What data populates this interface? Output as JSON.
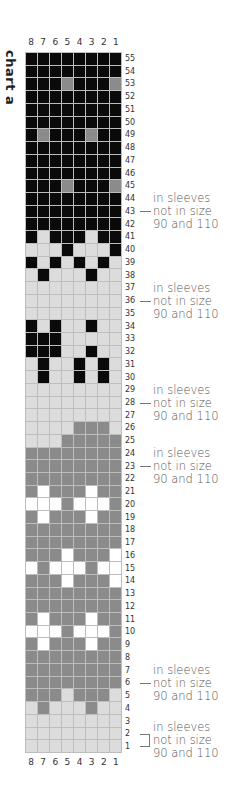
{
  "chart": {
    "title": "chart a",
    "columns": [
      "8",
      "7",
      "6",
      "5",
      "4",
      "3",
      "2",
      "1"
    ],
    "row_count": 55,
    "colors": {
      "B": "#0a0a0a",
      "L": "#dcdcdc",
      "G": "#8b8b8b",
      "W": "#ffffff"
    },
    "legend": {
      "B": "black",
      "L": "light grey",
      "G": "mid grey",
      "W": "white"
    },
    "rows": {
      "55": "BBBBBBBB",
      "54": "BBBBBBBB",
      "53": "BBBGBBBG",
      "52": "BBBBBBBB",
      "51": "BBBBBBBB",
      "50": "BBBBBBBB",
      "49": "BGBBBGBB",
      "48": "BBBBBBBB",
      "47": "BBBBBBBB",
      "46": "BBBBBBBB",
      "45": "BBBGBBBG",
      "44": "BBBBBBBB",
      "43": "BBBBBBBB",
      "42": "BBBBBBBB",
      "41": "BLBBBLBB",
      "40": "LLLBLLLB",
      "39": "BLBLBLBL",
      "38": "LBLLLBLL",
      "37": "LLLLLLLL",
      "36": "LLLLLLLL",
      "35": "LLLLLLLL",
      "34": "BLBLLBLL",
      "33": "BBBLLLLL",
      "32": "BBBLLBLL",
      "31": "LBLLBLBL",
      "30": "LBLLBLBL",
      "29": "LLLLLLLL",
      "28": "LLLLLLLL",
      "27": "LLLLLLLL",
      "26": "LLLLGGGL",
      "25": "LLLGGGGG",
      "24": "GGGGGGGG",
      "23": "GGGGGGGG",
      "22": "GGGGGGGG",
      "21": "GWGGGWGG",
      "20": "WWWGWWWG",
      "19": "GWGGGWGG",
      "18": "GGGGGGGG",
      "17": "GGGGGGGG",
      "16": "GGGWGGGW",
      "15": "WGWWWGWW",
      "14": "GGGWGGGW",
      "13": "GGGGGGGG",
      "12": "GGGGGGGG",
      "11": "GWGGGWGG",
      "10": "WWWGWWWG",
      "9": "GWGGGWGG",
      "8": "GGGGGGGG",
      "7": "GGGGGGGG",
      "6": "GGGGGGGG",
      "5": "GGGLGGGL",
      "4": "LGLLLGLL",
      "3": "LLLLLLLL",
      "2": "LLLLLLLL",
      "1": "LLLLLLLL"
    }
  },
  "notes": [
    {
      "row": "43",
      "marker": "tick",
      "lines": [
        "in sleeves",
        "not in size",
        "90 and 110"
      ]
    },
    {
      "row": "36",
      "marker": "tick",
      "lines": [
        "in sleeves",
        "not in size",
        "90 and 110"
      ]
    },
    {
      "row": "28",
      "marker": "tick",
      "lines": [
        "in sleeves",
        "not in size",
        "90 and 110"
      ]
    },
    {
      "row": "23",
      "marker": "tick",
      "lines": [
        "in sleeves",
        "not in size",
        "90 and 110"
      ]
    },
    {
      "row": "6",
      "marker": "tick",
      "lines": [
        "in sleeves",
        "not in size",
        "90 and 110"
      ]
    },
    {
      "row": "2-1",
      "marker": "bracket",
      "lines": [
        "in sleeves",
        "not in size",
        "90 and 110"
      ]
    }
  ]
}
